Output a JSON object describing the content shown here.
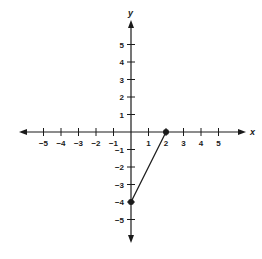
{
  "chart_data": {
    "type": "line",
    "title": "",
    "xlabel": "x",
    "ylabel": "y",
    "xlim": [
      -5,
      5
    ],
    "ylim": [
      -5,
      5
    ],
    "grid": false,
    "x_ticks": [
      -5,
      -4,
      -3,
      -2,
      -1,
      1,
      2,
      3,
      4,
      5
    ],
    "y_ticks": [
      5,
      4,
      3,
      2,
      1,
      -1,
      -2,
      -3,
      -4,
      -5
    ],
    "x_tick_labels": [
      "−5",
      "−4",
      "−3",
      "−2",
      "−1",
      "1",
      "2",
      "3",
      "4",
      "5"
    ],
    "y_tick_labels": [
      "5",
      "4",
      "3",
      "2",
      "1",
      "−1",
      "−2",
      "−3",
      "−4",
      "−5"
    ],
    "series": [
      {
        "name": "segment",
        "points": [
          [
            2,
            0
          ],
          [
            0,
            -4
          ]
        ],
        "x": [
          2,
          0
        ],
        "y": [
          0,
          -4
        ],
        "markers": "filled-circle"
      }
    ],
    "legend": null
  },
  "colors": {
    "ink": "#1a1a1a",
    "background": "#ffffff"
  }
}
